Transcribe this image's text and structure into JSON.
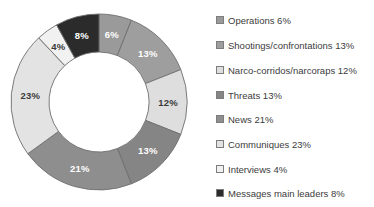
{
  "chart_data": {
    "type": "pie",
    "variant": "donut",
    "title": "",
    "subtitle": "",
    "xlabel": "",
    "ylabel": "",
    "grid": false,
    "legend_position": "right",
    "start_angle_deg": 0,
    "direction": "clockwise",
    "units": "percent",
    "total": 100,
    "categories": [
      "Operations",
      "Shootings/confrontations",
      "Narco-corridos/narcoraps",
      "Threats",
      "News",
      "Communiques",
      "Interviews",
      "Messages main leaders"
    ],
    "values": [
      6,
      13,
      12,
      13,
      21,
      23,
      4,
      8
    ],
    "slice_labels": [
      "6%",
      "13%",
      "12%",
      "13%",
      "21%",
      "23%",
      "4%",
      "8%"
    ],
    "colors": [
      "#9a9a9a",
      "#9e9e9e",
      "#dedede",
      "#858585",
      "#8e8e8e",
      "#e3e3e3",
      "#f1f1f1",
      "#2b2b2b"
    ],
    "label_colors": [
      "#ffffff",
      "#ffffff",
      "#3a3a3a",
      "#ffffff",
      "#ffffff",
      "#3a3a3a",
      "#3a3a3a",
      "#ffffff"
    ]
  },
  "chart": {
    "center_x": 99,
    "center_y": 102,
    "outer_radius": 88,
    "inner_radius": 50,
    "label_radius": 69,
    "stroke_color": "#6e6e6e",
    "background": "#ffffff"
  },
  "legend": {
    "items": [
      {
        "label": "Operations 6%",
        "name": "operations",
        "color": "#9a9a9a",
        "y": 14
      },
      {
        "label": "Shootings/confrontations 13%",
        "name": "shootings",
        "color": "#9e9e9e",
        "y": 39
      },
      {
        "label": "Narco-corridos/narcoraps 12%",
        "name": "narco-corridos",
        "color": "#dedede",
        "y": 64
      },
      {
        "label": "Threats 13%",
        "name": "threats",
        "color": "#858585",
        "y": 89
      },
      {
        "label": "News 21%",
        "name": "news",
        "color": "#8e8e8e",
        "y": 113
      },
      {
        "label": "Communiques 23%",
        "name": "communiques",
        "color": "#e3e3e3",
        "y": 138
      },
      {
        "label": "Interviews 4%",
        "name": "interviews",
        "color": "#f1f1f1",
        "y": 163
      },
      {
        "label": "Messages main leaders 8%",
        "name": "messages-main-leaders",
        "color": "#2b2b2b",
        "y": 187
      }
    ]
  }
}
